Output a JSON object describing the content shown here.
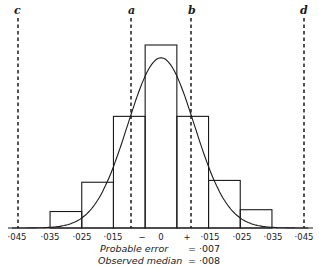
{
  "chart_data": {
    "type": "bar",
    "title": "",
    "xlabel": "",
    "ylabel": "",
    "x_tick_labels": [
      "·045",
      "·035",
      "·025",
      "·015",
      "−",
      "0",
      "+",
      "·015",
      "·025",
      "·035",
      "·045"
    ],
    "bins": [
      {
        "from": -0.035,
        "to": -0.025,
        "relative_height": 0.09
      },
      {
        "from": -0.025,
        "to": -0.015,
        "relative_height": 0.25
      },
      {
        "from": -0.015,
        "to": -0.005,
        "relative_height": 0.61
      },
      {
        "from": -0.005,
        "to": 0.005,
        "relative_height": 1.0
      },
      {
        "from": 0.005,
        "to": 0.015,
        "relative_height": 0.61
      },
      {
        "from": 0.015,
        "to": 0.025,
        "relative_height": 0.26
      },
      {
        "from": 0.025,
        "to": 0.035,
        "relative_height": 0.1
      }
    ],
    "curve": {
      "type": "normal",
      "mean": 0,
      "peak_relative_height": 0.93
    },
    "reference_lines": [
      {
        "label": "c",
        "x": -0.043,
        "style": "dashed"
      },
      {
        "label": "a",
        "x": -0.0075,
        "style": "dashed"
      },
      {
        "label": "b",
        "x": 0.0075,
        "style": "dashed"
      },
      {
        "label": "d",
        "x": 0.0445,
        "style": "dashed"
      }
    ],
    "xlim": [
      -0.048,
      0.048
    ],
    "grid": false,
    "legend": null
  },
  "annotations": {
    "probable_error_label": "Probable error",
    "probable_error_value": "= ·007",
    "observed_median_label": "Observed median",
    "observed_median_value": "= ·008"
  },
  "line_labels": {
    "c": "c",
    "a": "a",
    "b": "b",
    "d": "d"
  },
  "ticks": [
    "·045",
    "·035",
    "·025",
    "·015",
    "−",
    "0",
    "+",
    "·015",
    "·025",
    "·035",
    "·045"
  ]
}
